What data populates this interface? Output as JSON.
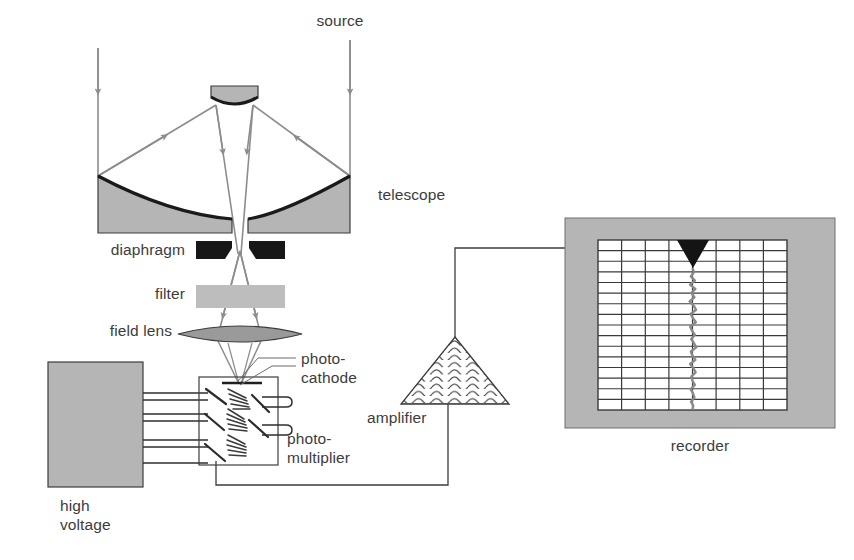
{
  "figure": {
    "background": "#ffffff",
    "ink": "#3c3c3c",
    "gray_fill": "#b5b5b5",
    "dark_fill": "#171717",
    "ray_color": "#8c8c8c",
    "grid_color": "#3a3a3a"
  },
  "labels": {
    "source": "source",
    "telescope": "telescope",
    "diaphragm": "diaphragm",
    "filter": "filter",
    "field_lens": "field lens",
    "photocathode_line1": "photo-",
    "photocathode_line2": "cathode",
    "photomultiplier_line1": "photo-",
    "photomultiplier_line2": "multiplier",
    "high_voltage_line1": "high",
    "high_voltage_line2": "voltage",
    "amplifier": "amplifier",
    "recorder": "recorder"
  },
  "components": {
    "source_rays": {
      "name": "incoming starlight rays",
      "count": 2,
      "direction": "downward"
    },
    "telescope": {
      "type": "Cassegrain reflector",
      "primary_mirror": "concave segmented",
      "secondary_mirror": "convex"
    },
    "diaphragm": {
      "aperture": "central notch",
      "fill": "#171717"
    },
    "filter": {
      "fill": "#bdbdbd"
    },
    "field_lens": {
      "shape": "biconvex lens",
      "fill": "#9a9a9a"
    },
    "photomultiplier": {
      "dynode_count": 5,
      "hv_wire_count": 4,
      "anode_pin_count": 2
    },
    "high_voltage": {
      "fill": "#b5b5b5"
    },
    "amplifier": {
      "shape": "triangle",
      "hatch": "wavy lines"
    },
    "recorder": {
      "frame_fill": "#b5b5b5",
      "chart_fill": "#ffffff",
      "pen_marker": "filled triangle"
    }
  },
  "chart_data": {
    "type": "line",
    "columns": 8,
    "rows": 16,
    "orientation": "vertical-time",
    "xlabel": "",
    "ylabel": "",
    "grid": true,
    "legend": "none",
    "pen_position_column": 4,
    "trace_description": "noisy vertical pen trace oscillating about column 4",
    "x": [
      0,
      1,
      2,
      3,
      4,
      5,
      6,
      7,
      8,
      9,
      10,
      11,
      12,
      13,
      14,
      15,
      16,
      17,
      18,
      19,
      20,
      21,
      22,
      23,
      24,
      25,
      26,
      27,
      28,
      29,
      30,
      31,
      32,
      33,
      34
    ],
    "values": [
      4.0,
      4.06,
      3.93,
      4.1,
      3.9,
      4.12,
      3.95,
      4.08,
      3.88,
      4.05,
      4.15,
      3.92,
      4.02,
      4.14,
      3.9,
      3.98,
      4.1,
      3.95,
      4.06,
      4.16,
      3.93,
      4.0,
      4.12,
      3.9,
      4.04,
      4.13,
      3.95,
      4.0,
      4.1,
      3.92,
      4.02,
      4.08,
      3.94,
      4.03,
      4.0
    ]
  }
}
